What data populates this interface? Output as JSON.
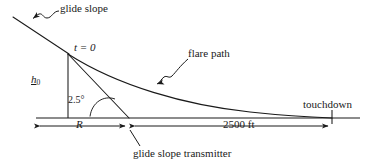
{
  "diagram": {
    "labels": {
      "glide_slope": "glide slope",
      "t_zero": "t = 0",
      "h_zero_main": "h",
      "h_zero_sub": "0",
      "angle": "2.5°",
      "flare_path": "flare path",
      "touchdown": "touchdown",
      "range": "R",
      "distance": "2500 ft",
      "transmitter": "glide slope transmitter"
    },
    "colors": {
      "stroke": "#1a1a1a",
      "background": "#ffffff",
      "text": "#1a1a1a"
    },
    "geometry": {
      "ground_y": 118,
      "t0_x": 68,
      "t0_y": 53,
      "transmitter_x": 129,
      "touchdown_x": 332,
      "glide_slope_top_x": 13,
      "glide_slope_top_y": 17,
      "ground_left_x": 36,
      "ground_right_x": 360,
      "glide_angle_deg": 2.5
    },
    "dimension_lines": {
      "range_start_x": 38,
      "range_end_x": 127,
      "distance_start_x": 133,
      "distance_end_x": 330,
      "dim_y": 126
    }
  }
}
